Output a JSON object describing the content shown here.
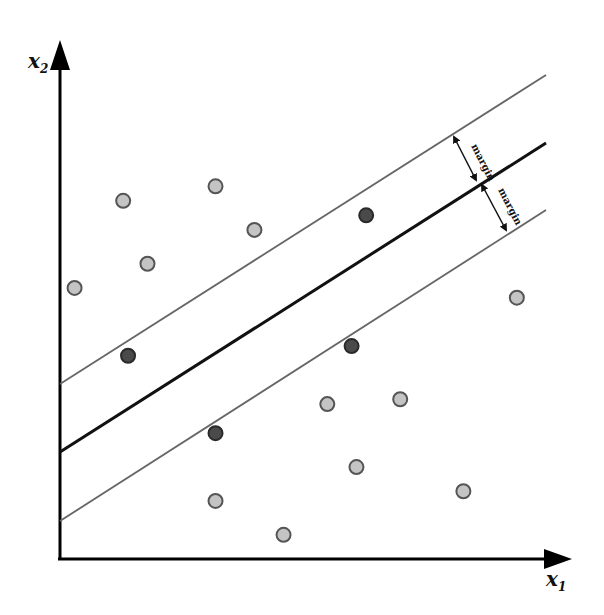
{
  "axes": {
    "x_label": "x",
    "x_sub": "1",
    "y_label": "x",
    "y_sub": "2"
  },
  "annotations": {
    "margin_upper": "margin",
    "margin_lower": "margin"
  },
  "colors": {
    "class_point_fill": "#c4c4c4",
    "class_point_stroke": "#555555",
    "support_vector_fill": "#4a4a4a",
    "support_vector_stroke": "#2a2a2a",
    "hyperplane": "#111111",
    "margin_line": "#666666",
    "axis": "#000000"
  },
  "lines": {
    "hyperplane": {
      "name": "decision-boundary",
      "y_at_x0": 0.19,
      "y_at_x1": 0.77
    },
    "upper_margin": {
      "name": "upper-margin-line",
      "y_at_x0": 0.32,
      "y_at_x1": 0.9
    },
    "lower_margin": {
      "name": "lower-margin-line",
      "y_at_x0": 0.06,
      "y_at_x1": 0.65
    }
  },
  "points": {
    "class_a": [
      [
        0.03,
        0.56
      ],
      [
        0.13,
        0.74
      ],
      [
        0.18,
        0.61
      ],
      [
        0.32,
        0.77
      ],
      [
        0.4,
        0.68
      ]
    ],
    "class_b": [
      [
        0.55,
        0.32
      ],
      [
        0.7,
        0.33
      ],
      [
        0.61,
        0.19
      ],
      [
        0.32,
        0.12
      ],
      [
        0.46,
        0.05
      ],
      [
        0.83,
        0.14
      ],
      [
        0.94,
        0.54
      ]
    ],
    "support_vectors_a": [
      [
        0.14,
        0.42
      ],
      [
        0.63,
        0.71
      ]
    ],
    "support_vectors_b": [
      [
        0.32,
        0.26
      ],
      [
        0.6,
        0.44
      ]
    ]
  }
}
